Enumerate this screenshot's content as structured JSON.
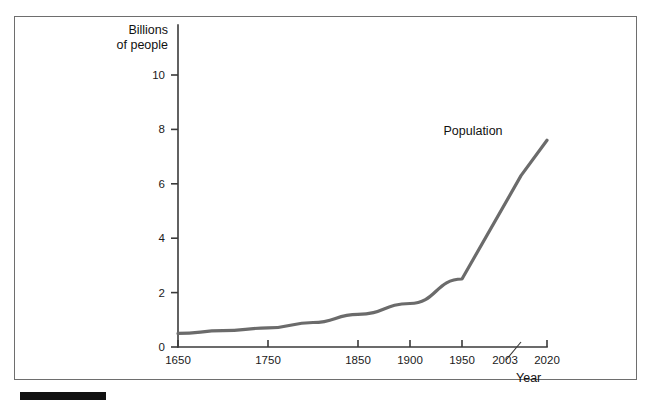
{
  "figure": {
    "frame_border_color": "#6e6e6e",
    "background_color": "#ffffff",
    "bottom_rule_color": "#111111"
  },
  "chart_data": {
    "type": "line",
    "title": "",
    "subtitle": "",
    "xlabel": "Year",
    "ylabel": "Billions of people",
    "ylabel_line1": "Billions",
    "ylabel_line2": "of people",
    "series_label": "Population",
    "line_color": "#6b6b6b",
    "grid": false,
    "legend_position": "inline-annotation",
    "xlim": [
      1650,
      2020
    ],
    "ylim": [
      0,
      11
    ],
    "x_tick_labels": [
      "1650",
      "1750",
      "1850",
      "1900",
      "1950",
      "2003",
      "2020"
    ],
    "x_ticks": [
      1650,
      1750,
      1850,
      1900,
      1950,
      2003,
      2020
    ],
    "y_tick_labels": [
      "0",
      "2",
      "4",
      "6",
      "8",
      "10"
    ],
    "y_ticks": [
      0,
      2,
      4,
      6,
      8,
      10
    ],
    "x": [
      1650,
      1700,
      1750,
      1800,
      1850,
      1900,
      1950,
      2003,
      2020
    ],
    "values": [
      0.5,
      0.6,
      0.7,
      0.9,
      1.2,
      1.6,
      2.5,
      6.3,
      7.6
    ],
    "series": [
      {
        "name": "Population",
        "x": [
          1650,
          1700,
          1750,
          1800,
          1850,
          1900,
          1950,
          2003,
          2020
        ],
        "values": [
          0.5,
          0.6,
          0.7,
          0.9,
          1.2,
          1.6,
          2.5,
          6.3,
          7.6
        ]
      }
    ],
    "annotations": [
      {
        "text": "Population",
        "x": 1930,
        "y": 8.0
      }
    ]
  }
}
